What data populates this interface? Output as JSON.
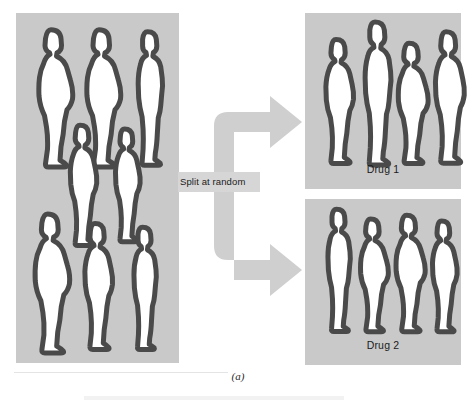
{
  "figure": {
    "caption": "(a)",
    "type": "randomized-trial-diagram"
  },
  "pool_panel": {
    "name": "participant-pool",
    "background_color": "#c9c9c9",
    "figure_count": 8,
    "figures": [
      {
        "id": "pool-1",
        "row": 1,
        "slot": 1,
        "height_px": 146,
        "build": "heavy",
        "left": 10,
        "top": 12
      },
      {
        "id": "pool-2",
        "row": 1,
        "slot": 2,
        "height_px": 146,
        "build": "heavy",
        "left": 58,
        "top": 12
      },
      {
        "id": "pool-3",
        "row": 1,
        "slot": 3,
        "height_px": 142,
        "build": "slim",
        "left": 107,
        "top": 14
      },
      {
        "id": "pool-4",
        "row": 2,
        "slot": 1,
        "height_px": 128,
        "build": "medium",
        "left": 42,
        "top": 108
      },
      {
        "id": "pool-5",
        "row": 2,
        "slot": 2,
        "height_px": 120,
        "build": "medium",
        "left": 88,
        "top": 112
      },
      {
        "id": "pool-6",
        "row": 3,
        "slot": 1,
        "height_px": 148,
        "build": "heavy",
        "left": 6,
        "top": 196
      },
      {
        "id": "pool-7",
        "row": 3,
        "slot": 2,
        "height_px": 134,
        "build": "medium",
        "left": 56,
        "top": 206
      },
      {
        "id": "pool-8",
        "row": 3,
        "slot": 3,
        "height_px": 130,
        "build": "slim",
        "left": 104,
        "top": 210
      }
    ]
  },
  "split": {
    "label": "Split at random",
    "label_background": "#d6d6d6",
    "arrow_color": "#cfcfcf",
    "branches": [
      {
        "id": "branch-up",
        "direction": "up-right",
        "target": "Drug 1"
      },
      {
        "id": "branch-down",
        "direction": "down-right",
        "target": "Drug 2"
      }
    ]
  },
  "groups": [
    {
      "id": "drug-1",
      "label": "Drug 1",
      "background_color": "#c9c9c9",
      "figure_count": 4,
      "figures": [
        {
          "id": "d1-1",
          "height_px": 132,
          "build": "medium",
          "left": 8,
          "top": 22
        },
        {
          "id": "d1-2",
          "height_px": 152,
          "build": "slim",
          "left": 44,
          "top": 4
        },
        {
          "id": "d1-3",
          "height_px": 128,
          "build": "heavy",
          "left": 82,
          "top": 26
        },
        {
          "id": "d1-4",
          "height_px": 140,
          "build": "medium",
          "left": 117,
          "top": 14
        }
      ]
    },
    {
      "id": "drug-2",
      "label": "Drug 2",
      "background_color": "#c9c9c9",
      "figure_count": 4,
      "figures": [
        {
          "id": "d2-1",
          "height_px": 130,
          "build": "slim",
          "left": 9,
          "top": 6
        },
        {
          "id": "d2-2",
          "height_px": 120,
          "build": "heavy",
          "left": 45,
          "top": 16
        },
        {
          "id": "d2-3",
          "height_px": 124,
          "build": "heavy",
          "left": 80,
          "top": 12
        },
        {
          "id": "d2-4",
          "height_px": 118,
          "build": "medium",
          "left": 116,
          "top": 18
        }
      ]
    }
  ],
  "colors": {
    "panel_gray": "#c9c9c9",
    "arrow_gray": "#cfcfcf",
    "label_gray": "#d6d6d6",
    "silhouette_fill": "#ffffff",
    "silhouette_stroke": "#4a4a4a",
    "text": "#1b1b1b",
    "page_background": "#ffffff"
  }
}
